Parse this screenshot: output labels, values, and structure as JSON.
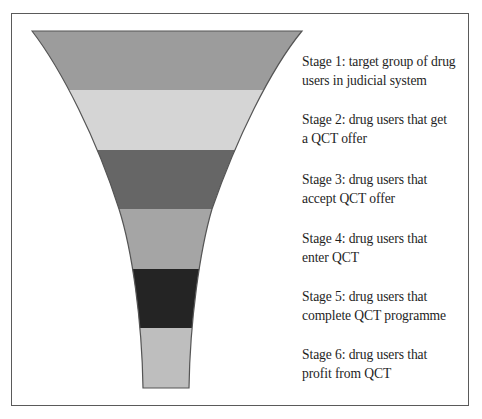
{
  "diagram": {
    "type": "funnel",
    "stages": [
      {
        "id": 1,
        "line1": "Stage 1: target group of drug",
        "line2": "users in judicial system",
        "color": "#9c9c9c"
      },
      {
        "id": 2,
        "line1": "Stage 2: drug users that get",
        "line2": "a QCT offer",
        "color": "#d5d5d5"
      },
      {
        "id": 3,
        "line1": "Stage 3: drug users that",
        "line2": "accept QCT offer",
        "color": "#666666"
      },
      {
        "id": 4,
        "line1": "Stage 4: drug users that",
        "line2": "enter QCT",
        "color": "#a5a5a5"
      },
      {
        "id": 5,
        "line1": "Stage 5: drug users that",
        "line2": "complete QCT programme",
        "color": "#242424"
      },
      {
        "id": 6,
        "line1": "Stage 6: drug users that",
        "line2": "profit from QCT",
        "color": "#bebebe"
      }
    ],
    "outline_color": "#555555",
    "frame_color": "#5a5a5a"
  }
}
